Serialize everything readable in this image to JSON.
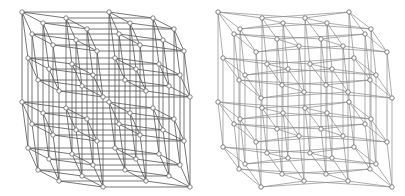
{
  "figure": {
    "panels": [
      {
        "name": "left-hypercube-drawing",
        "mode": "linear",
        "origin": [
          22,
          12
        ],
        "basis": [
          [
            44,
            6
          ],
          [
            87,
            0
          ],
          [
            21,
            11
          ],
          [
            10,
            22
          ],
          [
            6,
            46
          ],
          [
            0,
            90
          ]
        ],
        "edge_color": "#555555"
      },
      {
        "name": "right-hypercube-drawing",
        "mode": "block",
        "origin": [
          218,
          12
        ],
        "block_points": [
          [
            0,
            0
          ],
          [
            44,
            6
          ],
          [
            87,
            6
          ],
          [
            131,
            0
          ],
          [
            22,
            17
          ],
          [
            65,
            11
          ],
          [
            109,
            11
          ],
          [
            153,
            17
          ],
          [
            16,
            22
          ],
          [
            59,
            27
          ],
          [
            103,
            27
          ],
          [
            147,
            22
          ],
          [
            38,
            40
          ],
          [
            81,
            34
          ],
          [
            125,
            34
          ],
          [
            169,
            40
          ]
        ],
        "block_offsets": [
          [
            0,
            0
          ],
          [
            5,
            46
          ],
          [
            0,
            90
          ],
          [
            5,
            135
          ]
        ],
        "edge_color": "#8a8a8a"
      }
    ],
    "node_radius": 2.2
  }
}
